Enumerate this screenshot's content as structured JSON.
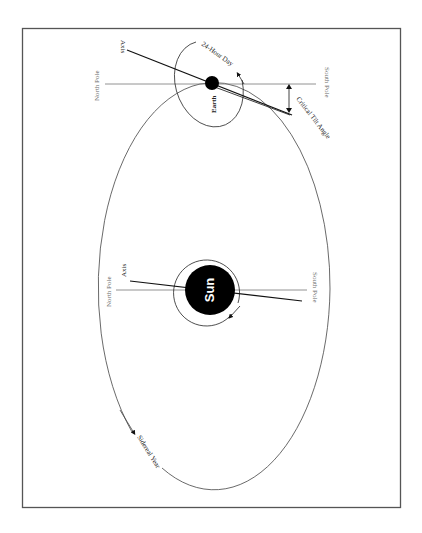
{
  "diagram": {
    "colors": {
      "background": "#ffffff",
      "frame": "#555555",
      "lines": "#222222",
      "pole_lines": "#777777",
      "labels": "#6a6a6a",
      "bodies": "#000000"
    },
    "labels": {
      "earth_axis": "Axis",
      "earth_north_pole": "North Pole",
      "earth_south_pole": "South Pole",
      "earth": "Earth",
      "day": "24-Hour Day",
      "tilt": "Critical Tilt Angle",
      "sun": "Sun",
      "sun_axis": "Axis",
      "sun_north_pole": "North Pole",
      "sun_south_pole": "South Pole",
      "year": "Sidereal Year"
    }
  }
}
